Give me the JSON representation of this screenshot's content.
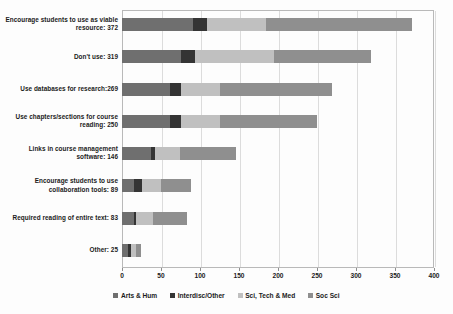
{
  "chart_data": {
    "type": "bar",
    "orientation": "horizontal",
    "stacked": true,
    "title": "",
    "xlabel": "",
    "ylabel": "",
    "xlim": [
      0,
      400
    ],
    "xticks": [
      0,
      50,
      100,
      150,
      200,
      250,
      300,
      350,
      400
    ],
    "xtick_labels": [
      "0",
      "50",
      "100",
      "150",
      "200",
      "250",
      "300",
      "350",
      "400"
    ],
    "grid": true,
    "legend_position": "bottom",
    "categories": [
      "Encourage students to use as viable resource: 372",
      "Don't use: 319",
      "Use databases for research:269",
      "Use chapters/sections for course reading: 250",
      "Links in course management software: 146",
      "Encourage students to use collaboration tools: 89",
      "Required reading of entire text: 83",
      "Other: 25"
    ],
    "category_totals": [
      372,
      319,
      269,
      250,
      146,
      89,
      83,
      25
    ],
    "series": [
      {
        "name": "Arts & Hum",
        "color": "#6f6f6f",
        "values": [
          91,
          76,
          62,
          62,
          37,
          15,
          15,
          8
        ]
      },
      {
        "name": "Interdisc/Other",
        "color": "#343434",
        "values": [
          18,
          18,
          14,
          14,
          5,
          11,
          3,
          3
        ]
      },
      {
        "name": "Sci, Tech & Med",
        "color": "#c0c0c0",
        "values": [
          76,
          101,
          50,
          50,
          32,
          24,
          22,
          7
        ]
      },
      {
        "name": "Soc Sci",
        "color": "#8f8f8f",
        "values": [
          187,
          124,
          143,
          124,
          72,
          39,
          43,
          7
        ]
      }
    ]
  },
  "legend": {
    "items": [
      {
        "label": "Arts & Hum",
        "color": "#6f6f6f"
      },
      {
        "label": "Interdisc/Other",
        "color": "#343434"
      },
      {
        "label": "Sci, Tech & Med",
        "color": "#c0c0c0"
      },
      {
        "label": "Soc Sci",
        "color": "#8f8f8f"
      }
    ]
  }
}
